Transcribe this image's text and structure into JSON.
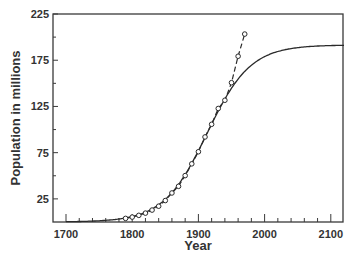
{
  "chart_data": {
    "type": "line",
    "title": "",
    "xlabel": "Year",
    "ylabel": "Population in millions",
    "xlim": [
      1680,
      2120
    ],
    "ylim": [
      0,
      225
    ],
    "xticks": [
      1700,
      1800,
      1900,
      2000,
      2100
    ],
    "yticks": [
      25,
      75,
      125,
      175,
      225
    ],
    "grid": false,
    "legend": null,
    "series": [
      {
        "name": "census data",
        "style": "dashed with open circle markers",
        "x": [
          1790,
          1800,
          1810,
          1820,
          1830,
          1840,
          1850,
          1860,
          1870,
          1880,
          1890,
          1900,
          1910,
          1920,
          1930,
          1940,
          1950,
          1960,
          1970
        ],
        "values": [
          3.9,
          5.3,
          7.2,
          9.6,
          12.9,
          17.1,
          23.2,
          31.4,
          38.6,
          50.2,
          62.9,
          76.0,
          92.0,
          105.7,
          122.8,
          131.7,
          150.7,
          179.3,
          203.3
        ]
      },
      {
        "name": "logistic model",
        "style": "solid",
        "x": [
          1700,
          1750,
          1790,
          1800,
          1820,
          1840,
          1860,
          1880,
          1900,
          1920,
          1940,
          1960,
          1980,
          2000,
          2020,
          2050,
          2100,
          2120
        ],
        "values": [
          0.5,
          1.5,
          3.9,
          5.3,
          9.6,
          17.0,
          29.5,
          48.5,
          74.0,
          103.0,
          131.5,
          154.5,
          170.5,
          180.5,
          186.0,
          189.5,
          191.0,
          191.2
        ]
      }
    ]
  }
}
